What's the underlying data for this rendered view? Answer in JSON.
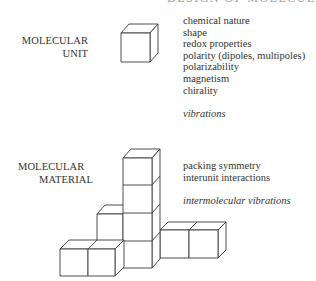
{
  "header": {
    "clipped_text": "DESIGN OF MOLECULAR MATERIALS"
  },
  "unit_section": {
    "label_line1": "MOLECULAR",
    "label_line2": "UNIT",
    "properties": [
      "chemical nature",
      "shape",
      "redox properties",
      "polarity (dipoles, multipoles)",
      "polarizability",
      "magnetism",
      "chirality"
    ],
    "italic_note": "vibrations"
  },
  "material_section": {
    "label_line1": "MOLECULAR",
    "label_line2": "MATERIAL",
    "properties": [
      "packing symmetry",
      "interunit interactions"
    ],
    "italic_note": "intermolecular vibrations"
  },
  "figure": {
    "single_cube_count": 1,
    "assembly_cube_count": 9,
    "line_color": "#3a3a3a",
    "background": "#ffffff"
  }
}
